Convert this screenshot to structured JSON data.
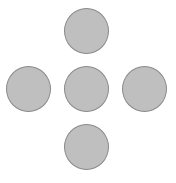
{
  "layout": "cross",
  "colors": {
    "background": "#ffffff",
    "circle_fill": "#bfbfbf",
    "circle_border": "#8a8a8a"
  },
  "circles": [
    {
      "id": "top",
      "position": "top"
    },
    {
      "id": "left",
      "position": "left"
    },
    {
      "id": "center",
      "position": "center"
    },
    {
      "id": "right",
      "position": "right"
    },
    {
      "id": "bottom",
      "position": "bottom"
    }
  ]
}
